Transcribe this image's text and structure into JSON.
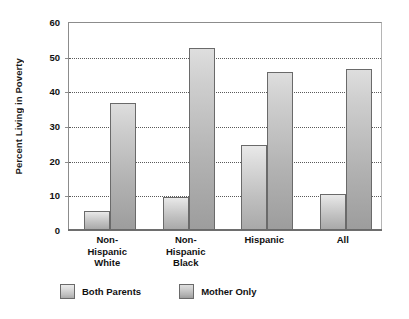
{
  "chart_data": {
    "type": "bar",
    "title": "",
    "xlabel": "",
    "ylabel": "Percent Living in Poverty",
    "ylim": [
      0,
      60
    ],
    "yticks": [
      0,
      10,
      20,
      30,
      40,
      50,
      60
    ],
    "grid": true,
    "legend_position": "bottom-left",
    "categories": [
      "Non-\nHispanic\nWhite",
      "Non-\nHispanic\nBlack",
      "Hispanic",
      "All"
    ],
    "category_lines": [
      [
        "Non-",
        "Hispanic",
        "White"
      ],
      [
        "Non-",
        "Hispanic",
        "Black"
      ],
      [
        "Hispanic"
      ],
      [
        "All"
      ]
    ],
    "series": [
      {
        "name": "Both Parents",
        "color": "#c8c8c8",
        "values": [
          5.5,
          9.5,
          24.5,
          10.5
        ]
      },
      {
        "name": "Mother Only",
        "color": "#b4b4b4",
        "values": [
          36.5,
          52.5,
          45.5,
          46.5
        ]
      }
    ]
  },
  "legend": {
    "items": [
      {
        "label": "Both Parents",
        "swatch": "both-parents"
      },
      {
        "label": "Mother Only",
        "swatch": "mother-only"
      }
    ]
  }
}
